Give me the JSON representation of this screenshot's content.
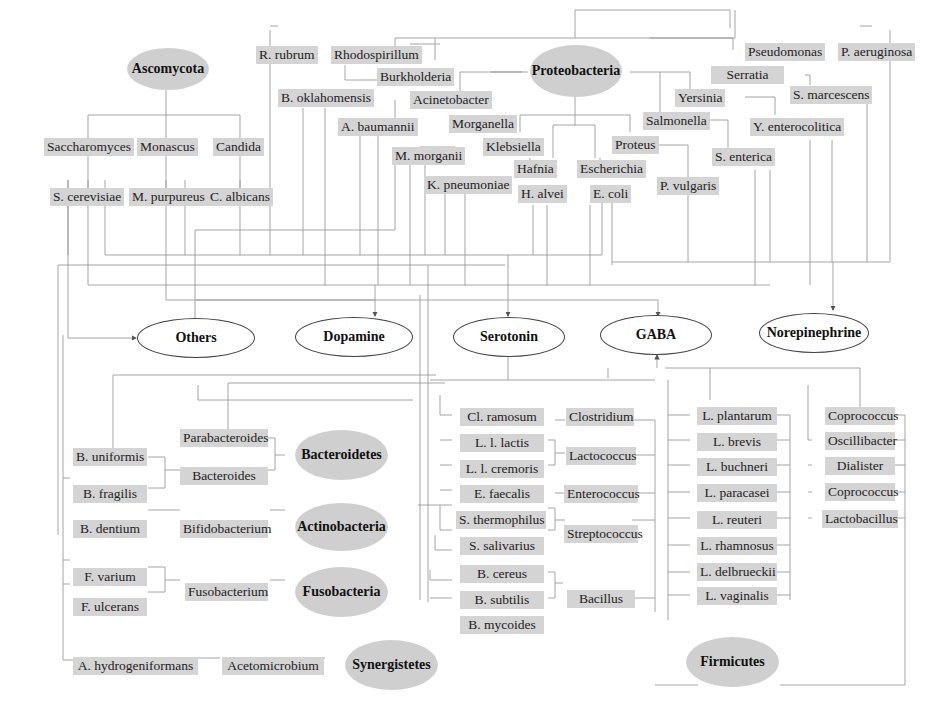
{
  "phyla": {
    "ascomycota": "Ascomycota",
    "proteobacteria": "Proteobacteria",
    "bacteroidetes": "Bacteroidetes",
    "actinobacteria": "Actinobacteria",
    "fusobacteria": "Fusobacteria",
    "synergistetes": "Synergistetes",
    "firmicutes": "Firmicutes"
  },
  "neurotransmitters": {
    "others": "Others",
    "dopamine": "Dopamine",
    "serotonin": "Serotonin",
    "gaba": "GABA",
    "norepinephrine": "Norepinephrine"
  },
  "ascomycota": {
    "genera": [
      "Saccharomyces",
      "Monascus",
      "Candida"
    ],
    "species": [
      "S. cerevisiae",
      "M. purpureus",
      "C. albicans"
    ]
  },
  "proteobacteria": {
    "genera": {
      "rhodospirillum": "Rhodospirillum",
      "burkholderia": "Burkholderia",
      "acinetobacter": "Acinetobacter",
      "morganella": "Morganella",
      "klebsiella": "Klebsiella",
      "hafnia": "Hafnia",
      "escherichia": "Escherichia",
      "proteus": "Proteus",
      "salmonella": "Salmonella",
      "yersinia": "Yersinia",
      "serratia": "Serratia",
      "pseudomonas": "Pseudomonas"
    },
    "species": {
      "r_rubrum": "R. rubrum",
      "b_oklahomensis": "B. oklahomensis",
      "a_baumannii": "A. baumannii",
      "m_morganii": "M. morganii",
      "k_pneumoniae": "K. pneumoniae",
      "h_alvei": "H. alvei",
      "e_coli": "E. coli",
      "p_vulgaris": "P. vulgaris",
      "s_enterica": "S. enterica",
      "y_enterocolitica": "Y. enterocolitica",
      "s_marcescens": "S. marcescens",
      "p_aeruginosa": "P. aeruginosa"
    }
  },
  "bacteroidetes": {
    "genera": [
      "Parabacteroides",
      "Bacteroides"
    ],
    "species": [
      "B. uniformis",
      "B. fragilis"
    ]
  },
  "actinobacteria": {
    "genus": "Bifidobacterium",
    "species": "B. dentium"
  },
  "fusobacteria": {
    "genus": "Fusobacterium",
    "species": [
      "F. varium",
      "F. ulcerans"
    ]
  },
  "synergistetes": {
    "genus": "Acetomicrobium",
    "species": "A. hydrogeniformans"
  },
  "firmicutes": {
    "genera_left": [
      "Clostridium",
      "Lactococcus",
      "Enterococcus",
      "Streptococcus",
      "Bacillus"
    ],
    "species_left": [
      "Cl. ramosum",
      "L. l. lactis",
      "L. l. cremoris",
      "E. faecalis",
      "S. thermophilus",
      "S. salivarius",
      "B. cereus",
      "B. subtilis",
      "B. mycoides"
    ],
    "lactobacillus_species": [
      "L. plantarum",
      "L. brevis",
      "L. buchneri",
      "L. paracasei",
      "L. reuteri",
      "L. rhamnosus",
      "L. delbrueckii",
      "L. vaginalis"
    ],
    "genera_right": [
      "Coprococcus",
      "Oscillibacter",
      "Dialister",
      "Coprococcus",
      "Lactobacillus"
    ]
  }
}
